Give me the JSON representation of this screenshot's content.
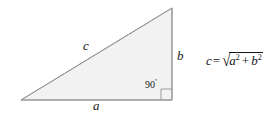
{
  "figure": {
    "type": "right-triangle-pythagorean-diagram",
    "background_color": "#ffffff",
    "triangle": {
      "fill_color": "#f2f2f2",
      "stroke_color": "#8c8c8c",
      "stroke_width": 1,
      "vertices": {
        "left": [
          21,
          100
        ],
        "apex": [
          172,
          8
        ],
        "bottom_right": [
          172,
          100
        ]
      }
    },
    "right_angle_marker": {
      "name": "right-angle-square",
      "x": 160,
      "y": 88,
      "size": 11,
      "stroke_color": "#8c8c8c"
    }
  },
  "labels": {
    "hypotenuse": "c",
    "vertical_side": "b",
    "base_side": "a",
    "angle_value": "90",
    "angle_degree_symbol": "º"
  },
  "formula": {
    "result_var": "c",
    "equals": "=",
    "radical_sign": "√",
    "term_a_base": "a",
    "term_a_exponent": "2",
    "operator": "+",
    "term_b_base": "b",
    "term_b_exponent": "2",
    "plain_text": "c = √(a² + b²)"
  },
  "colors": {
    "ink": "#171717",
    "line": "#8c8c8c",
    "fill": "#f2f2f2"
  }
}
